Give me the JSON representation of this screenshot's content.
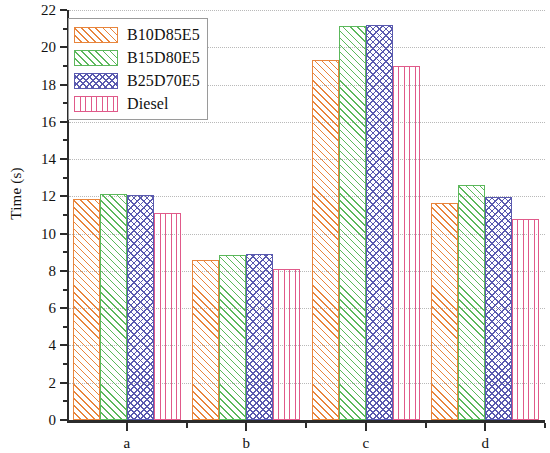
{
  "chart_data": {
    "type": "bar",
    "title": "",
    "xlabel": "",
    "ylabel": "Time (s)",
    "categories": [
      "a",
      "b",
      "c",
      "d"
    ],
    "ylim": [
      0,
      22
    ],
    "ytick_step": 2,
    "yticks": [
      0,
      2,
      4,
      6,
      8,
      10,
      12,
      14,
      16,
      18,
      20,
      22
    ],
    "ytick_labels": [
      "0",
      "2",
      "4",
      "6",
      "8",
      "10",
      "12",
      "14",
      "16",
      "18",
      "20",
      "22"
    ],
    "minor_yticks": [
      1,
      3,
      5,
      7,
      9,
      11,
      13,
      15,
      17,
      19,
      21
    ],
    "grid": "horizontal-dotted",
    "legend_position": "upper-left",
    "series": [
      {
        "name": "B10D85E5",
        "color": "#E8853C",
        "pattern": "diagonal",
        "values": [
          11.85,
          8.6,
          19.3,
          11.65
        ]
      },
      {
        "name": "B15D80E5",
        "color": "#5CB85C",
        "pattern": "diagonal",
        "values": [
          12.15,
          8.85,
          21.15,
          12.6
        ]
      },
      {
        "name": "B25D70E5",
        "color": "#5A5AAF",
        "pattern": "cross",
        "values": [
          12.1,
          8.9,
          21.2,
          11.95
        ]
      },
      {
        "name": "Diesel",
        "color": "#E05A8A",
        "pattern": "vertical",
        "values": [
          11.1,
          8.1,
          19.0,
          10.8
        ]
      }
    ]
  },
  "axis": {
    "line_color": "#2b2b2b",
    "grid_color": "#b9b9b9"
  }
}
